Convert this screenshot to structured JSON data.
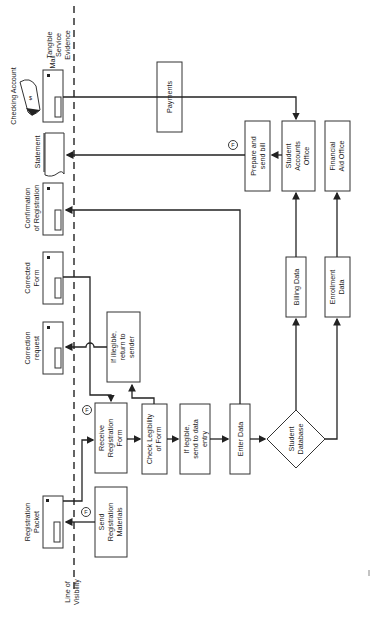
{
  "lanes": {
    "line_of_visibility": [
      "Line of",
      "Visibility"
    ],
    "tangible_evidence": [
      "Tangible",
      "Service",
      "Evidence"
    ]
  },
  "evidence": {
    "checking_account": "Checking Account",
    "mail": "Mail",
    "statement": "Statement",
    "confirmation": [
      "Confirmation",
      "of Registration"
    ],
    "corrected_form": [
      "Corrected",
      "Form"
    ],
    "correction_request": [
      "Correction",
      "request"
    ],
    "registration_packet": [
      "Registration",
      "Packet"
    ]
  },
  "processes": {
    "payments": "Payments",
    "prepare_bill": [
      "Prepare and",
      "send bill"
    ],
    "student_accounts": [
      "Student",
      "Accounts",
      "Office"
    ],
    "financial_aid": [
      "Financial",
      "Aid Office"
    ],
    "billing_data": "Billing Data",
    "enrollment_data": [
      "Enrollment",
      "Data"
    ],
    "if_illegible": [
      "If illegible,",
      "return to",
      "sender"
    ],
    "receive_form": [
      "Receive",
      "Registration",
      "Form"
    ],
    "check_legibility": [
      "Check Legibility",
      "of Form"
    ],
    "if_legible": [
      "If legible,",
      "send to data",
      "entry"
    ],
    "enter_data": "Enter Data",
    "student_database": [
      "Student",
      "Database"
    ],
    "send_materials": [
      "Send",
      "Registration",
      "Materials"
    ]
  },
  "fail_point": "F"
}
